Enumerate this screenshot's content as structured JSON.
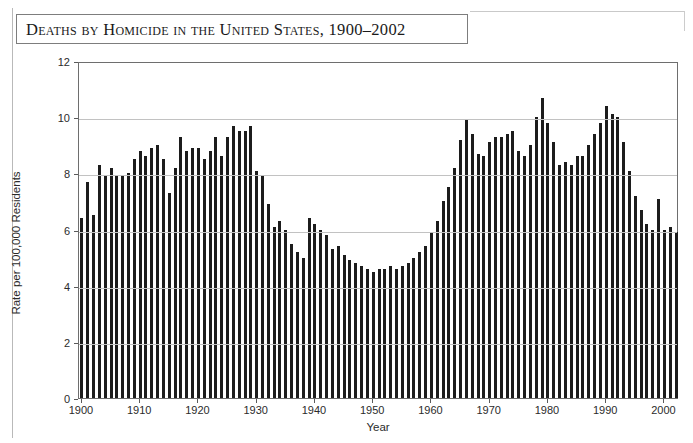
{
  "figure": {
    "title": "Deaths by Homicide in the United States, 1900–2002",
    "background_color": "#ffffff",
    "bar_color": "#1c1c1c",
    "grid_color": "#c2c2c2",
    "axis_color": "#6e6e6e"
  },
  "chart_data": {
    "type": "bar",
    "title": "Deaths by Homicide in the United States, 1900–2002",
    "xlabel": "Year",
    "ylabel": "Rate per 100,000 Residents",
    "xlim": [
      1899.5,
      2002.5
    ],
    "ylim": [
      0,
      12
    ],
    "ytick_values": [
      0,
      2,
      4,
      6,
      8,
      10,
      12
    ],
    "ytick_labels": [
      "0",
      "2",
      "4",
      "6",
      "8",
      "10",
      "12"
    ],
    "xtick_values": [
      1900,
      1910,
      1920,
      1930,
      1940,
      1950,
      1960,
      1970,
      1980,
      1990,
      2000
    ],
    "xtick_labels": [
      "1900",
      "1910",
      "1920",
      "1930",
      "1940",
      "1950",
      "1960",
      "1970",
      "1980",
      "1990",
      "2000"
    ],
    "grid": "horizontal",
    "legend": "none",
    "x": [
      1900,
      1901,
      1902,
      1903,
      1904,
      1905,
      1906,
      1907,
      1908,
      1909,
      1910,
      1911,
      1912,
      1913,
      1914,
      1915,
      1916,
      1917,
      1918,
      1919,
      1920,
      1921,
      1922,
      1923,
      1924,
      1925,
      1926,
      1927,
      1928,
      1929,
      1930,
      1931,
      1932,
      1933,
      1934,
      1935,
      1936,
      1937,
      1938,
      1939,
      1940,
      1941,
      1942,
      1943,
      1944,
      1945,
      1946,
      1947,
      1948,
      1949,
      1950,
      1951,
      1952,
      1953,
      1954,
      1955,
      1956,
      1957,
      1958,
      1959,
      1960,
      1961,
      1962,
      1963,
      1964,
      1965,
      1966,
      1967,
      1968,
      1969,
      1970,
      1971,
      1972,
      1973,
      1974,
      1975,
      1976,
      1977,
      1978,
      1979,
      1980,
      1981,
      1982,
      1983,
      1984,
      1985,
      1986,
      1987,
      1988,
      1989,
      1990,
      1991,
      1992,
      1993,
      1994,
      1995,
      1996,
      1997,
      1998,
      1999,
      2000,
      2001,
      2002
    ],
    "values": [
      6.4,
      7.7,
      6.5,
      8.3,
      7.9,
      8.2,
      7.9,
      7.9,
      8.0,
      8.5,
      8.8,
      8.6,
      8.9,
      9.0,
      8.5,
      7.3,
      8.2,
      9.3,
      8.8,
      8.9,
      8.9,
      8.5,
      8.8,
      9.3,
      8.6,
      9.3,
      9.7,
      9.5,
      9.5,
      9.7,
      8.1,
      7.9,
      6.9,
      6.1,
      6.3,
      6.0,
      5.5,
      5.2,
      5.0,
      6.4,
      6.2,
      6.0,
      5.8,
      5.3,
      5.4,
      5.1,
      4.9,
      4.8,
      4.7,
      4.6,
      4.5,
      4.6,
      4.6,
      4.7,
      4.6,
      4.7,
      4.8,
      5.0,
      5.2,
      5.4,
      5.9,
      6.3,
      7.0,
      7.5,
      8.2,
      9.2,
      9.9,
      9.4,
      8.7,
      8.6,
      9.1,
      9.3,
      9.3,
      9.4,
      9.5,
      8.8,
      8.6,
      9.0,
      10.0,
      10.7,
      9.8,
      9.1,
      8.3,
      8.4,
      8.3,
      8.6,
      8.6,
      9.0,
      9.4,
      9.8,
      10.4,
      10.1,
      10.0,
      9.1,
      8.1,
      7.2,
      6.7,
      6.2,
      6.0,
      7.1,
      6.0,
      6.1,
      5.9
    ]
  },
  "axis": {
    "year_label": "Year",
    "rate_label": "Rate per 100,000 Residents"
  }
}
